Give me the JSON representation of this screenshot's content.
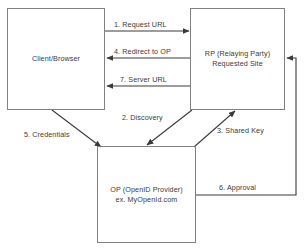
{
  "diagram": {
    "type": "flow-diagram",
    "stroke_color": "#808080",
    "arrow_color": "#3a3a3a",
    "text_color": "#3a3a3a",
    "background_color": "#ffffff",
    "nodes": [
      {
        "id": "client",
        "line1": "Client/Browser",
        "line2": ""
      },
      {
        "id": "rp",
        "line1": "RP (Relaying Party)",
        "line2": "Requested Site"
      },
      {
        "id": "op",
        "line1": "OP (OpenID Provider)",
        "line2": "ex. MyOpenId.com"
      }
    ],
    "edges": [
      {
        "step": "1",
        "label": "1. Request URL",
        "from": "client",
        "to": "rp",
        "direction": "right"
      },
      {
        "step": "2",
        "label": "2. Discovery",
        "from": "rp",
        "to": "op",
        "direction": "down-left"
      },
      {
        "step": "3",
        "label": "3. Shared Key",
        "from": "op",
        "to": "rp",
        "direction": "up-right"
      },
      {
        "step": "4",
        "label": "4. Redirect to OP",
        "from": "rp",
        "to": "client",
        "direction": "left"
      },
      {
        "step": "5",
        "label": "5. Credentials",
        "from": "client",
        "to": "op",
        "direction": "down-right"
      },
      {
        "step": "6",
        "label": "6. Approval",
        "from": "op",
        "to": "rp",
        "direction": "right-up-left"
      },
      {
        "step": "7",
        "label": "7. Server URL",
        "from": "rp",
        "to": "client",
        "direction": "left"
      }
    ]
  }
}
